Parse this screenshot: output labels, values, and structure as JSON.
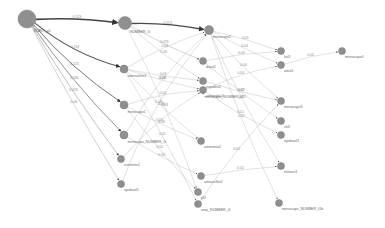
{
  "graph": {
    "background": "#ffffff",
    "node_color": "#8f8f8f",
    "nodes": [
      {
        "id": "n0",
        "label": "START_p1",
        "x": 27,
        "y": 19,
        "r": 9
      },
      {
        "id": "n1",
        "label": "NUMBER_t1",
        "x": 125,
        "y": 23,
        "r": 6.5
      },
      {
        "id": "n2",
        "label": "mesocaps2",
        "x": 209,
        "y": 30,
        "r": 4.5
      },
      {
        "id": "n3",
        "label": "adrenaline2",
        "x": 124,
        "y": 69,
        "r": 4
      },
      {
        "id": "n4",
        "label": "mesocaps1",
        "x": 124,
        "y": 105,
        "r": 4
      },
      {
        "id": "n5",
        "label": "mesocaps_NUMBER_t1",
        "x": 124,
        "y": 135,
        "r": 4
      },
      {
        "id": "n6",
        "label": "nutrients1",
        "x": 121,
        "y": 159,
        "r": 3.5
      },
      {
        "id": "n7",
        "label": "epidural1",
        "x": 121,
        "y": 184,
        "r": 3.5
      },
      {
        "id": "n8",
        "label": "days2",
        "x": 203,
        "y": 61,
        "r": 3.5
      },
      {
        "id": "n9",
        "label": "ergodex2",
        "x": 203,
        "y": 81,
        "r": 3.5
      },
      {
        "id": "n10",
        "label": "antiseptic2",
        "x": 203,
        "y": 90,
        "r": 3.5
      },
      {
        "id": "n11",
        "label": "mesocaps_NUMBER_t2",
        "x": 203,
        "y": 93,
        "r": 1
      },
      {
        "id": "n12",
        "label": "ammonia2",
        "x": 201,
        "y": 141,
        "r": 3.5
      },
      {
        "id": "n13",
        "label": "amoxicillin2",
        "x": 201,
        "y": 176,
        "r": 3.5
      },
      {
        "id": "n14",
        "label": "pf2",
        "x": 198,
        "y": 192,
        "r": 3.5
      },
      {
        "id": "n15",
        "label": "amp_NUMBER_t1",
        "x": 198,
        "y": 204,
        "r": 3.5
      },
      {
        "id": "n16",
        "label": "fut3",
        "x": 281,
        "y": 51,
        "r": 3.5
      },
      {
        "id": "n17",
        "label": "amu3",
        "x": 281,
        "y": 65,
        "r": 3.5
      },
      {
        "id": "n18",
        "label": "mesocaps4",
        "x": 342,
        "y": 51,
        "r": 3.5
      },
      {
        "id": "n19",
        "label": "mesocaps3",
        "x": 281,
        "y": 101,
        "r": 3.5
      },
      {
        "id": "n20",
        "label": "sti3",
        "x": 281,
        "y": 121,
        "r": 3.5
      },
      {
        "id": "n21",
        "label": "epidural3",
        "x": 281,
        "y": 135,
        "r": 3.5
      },
      {
        "id": "n22",
        "label": "nitrous3",
        "x": 281,
        "y": 166,
        "r": 3.5
      },
      {
        "id": "n23",
        "label": "mesocaps_NUMBER_t1b",
        "x": 279,
        "y": 203,
        "r": 3.5
      }
    ],
    "edges": [
      {
        "from": "n0",
        "to": "n1",
        "label": "0.513",
        "w": 1.6,
        "color": "#444444",
        "bend": -4
      },
      {
        "from": "n1",
        "to": "n2",
        "label": "0.513",
        "w": 1.4,
        "color": "#4a4a4a",
        "bend": -4
      },
      {
        "from": "n0",
        "to": "n3",
        "label": "0.194",
        "w": 1.1,
        "color": "#555555",
        "bend": 10
      },
      {
        "from": "n0",
        "to": "n4",
        "label": "0.123",
        "w": 0.9,
        "color": "#666666",
        "bend": 8
      },
      {
        "from": "n0",
        "to": "n5",
        "label": "0.085",
        "w": 0.8,
        "color": "#777777",
        "bend": 6
      },
      {
        "from": "n0",
        "to": "n6",
        "label": "0.076",
        "w": 0.6,
        "color": "#999999",
        "bend": 4
      },
      {
        "from": "n0",
        "to": "n7",
        "label": "0.06",
        "w": 0.5,
        "color": "#aaaaaa",
        "bend": 3
      },
      {
        "from": "n1",
        "to": "n8",
        "label": "0.073",
        "w": 0.5,
        "color": "#aaaaaa",
        "bend": 3
      },
      {
        "from": "n1",
        "to": "n9",
        "label": "0.05",
        "w": 0.4,
        "color": "#b4b4b4",
        "bend": 3
      },
      {
        "from": "n1",
        "to": "n14",
        "label": "0.03",
        "w": 0.4,
        "color": "#b4b4b4",
        "bend": -6
      },
      {
        "from": "n3",
        "to": "n2",
        "label": "0.04",
        "w": 0.4,
        "color": "#b4b4b4",
        "bend": -5
      },
      {
        "from": "n3",
        "to": "n10",
        "label": "0.05",
        "w": 0.4,
        "color": "#b4b4b4",
        "bend": 2
      },
      {
        "from": "n3",
        "to": "n9",
        "label": "0.04",
        "w": 0.4,
        "color": "#b4b4b4",
        "bend": 2
      },
      {
        "from": "n3",
        "to": "n12",
        "label": "0.03",
        "w": 0.4,
        "color": "#b4b4b4",
        "bend": 3
      },
      {
        "from": "n3",
        "to": "n15",
        "label": "0.02",
        "w": 0.4,
        "color": "#b4b4b4",
        "bend": -3
      },
      {
        "from": "n4",
        "to": "n10",
        "label": "0.04",
        "w": 0.4,
        "color": "#b4b4b4",
        "bend": -5
      },
      {
        "from": "n4",
        "to": "n12",
        "label": "0.03",
        "w": 0.4,
        "color": "#b4b4b4",
        "bend": 3
      },
      {
        "from": "n4",
        "to": "n14",
        "label": "0.02",
        "w": 0.4,
        "color": "#b4b4b4",
        "bend": 3
      },
      {
        "from": "n5",
        "to": "n2",
        "label": "0.04",
        "w": 0.4,
        "color": "#b4b4b4",
        "bend": -10
      },
      {
        "from": "n5",
        "to": "n13",
        "label": "0.03",
        "w": 0.4,
        "color": "#b4b4b4",
        "bend": 3
      },
      {
        "from": "n6",
        "to": "n10",
        "label": "0.03",
        "w": 0.4,
        "color": "#b4b4b4",
        "bend": -8
      },
      {
        "from": "n7",
        "to": "n2",
        "label": "0.03",
        "w": 0.4,
        "color": "#b4b4b4",
        "bend": -14
      },
      {
        "from": "n2",
        "to": "n16",
        "label": "0.05",
        "w": 0.4,
        "color": "#b4b4b4",
        "bend": -2
      },
      {
        "from": "n2",
        "to": "n17",
        "label": "0.04",
        "w": 0.4,
        "color": "#b4b4b4",
        "bend": 2
      },
      {
        "from": "n2",
        "to": "n19",
        "label": "0.04",
        "w": 0.4,
        "color": "#b4b4b4",
        "bend": 4
      },
      {
        "from": "n2",
        "to": "n22",
        "label": "0.03",
        "w": 0.4,
        "color": "#b4b4b4",
        "bend": 6
      },
      {
        "from": "n2",
        "to": "n23",
        "label": "0.02",
        "w": 0.4,
        "color": "#b4b4b4",
        "bend": 6
      },
      {
        "from": "n8",
        "to": "n16",
        "label": "0.03",
        "w": 0.4,
        "color": "#b4b4b4",
        "bend": -3
      },
      {
        "from": "n8",
        "to": "n20",
        "label": "0.02",
        "w": 0.4,
        "color": "#b4b4b4",
        "bend": 3
      },
      {
        "from": "n10",
        "to": "n17",
        "label": "0.03",
        "w": 0.4,
        "color": "#b4b4b4",
        "bend": -5
      },
      {
        "from": "n10",
        "to": "n21",
        "label": "0.02",
        "w": 0.4,
        "color": "#b4b4b4",
        "bend": 4
      },
      {
        "from": "n9",
        "to": "n19",
        "label": "0.02",
        "w": 0.4,
        "color": "#b4b4b4",
        "bend": 2
      },
      {
        "from": "n13",
        "to": "n22",
        "label": "0.02",
        "w": 0.4,
        "color": "#b4b4b4",
        "bend": -2
      },
      {
        "from": "n15",
        "to": "n19",
        "label": "0.02",
        "w": 0.4,
        "color": "#b4b4b4",
        "bend": -6
      },
      {
        "from": "n17",
        "to": "n18",
        "label": "0.02",
        "w": 0.4,
        "color": "#b4b4b4",
        "bend": -3
      }
    ]
  }
}
